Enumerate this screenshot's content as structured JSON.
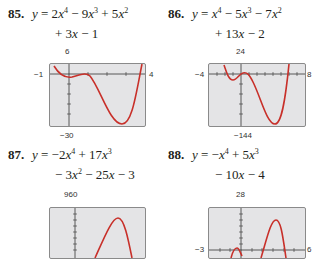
{
  "problems": [
    {
      "number": "85.",
      "line1": "y = 2x⁴ − 9x³ + 5x²",
      "line2": "+ 3x − 1",
      "window": {
        "xmin": "−1",
        "xmax": "4",
        "ymax": "6",
        "ymin": "−30"
      }
    },
    {
      "number": "86.",
      "line1": "y = x⁴ − 5x³ − 7x²",
      "line2": "+ 13x − 2",
      "window": {
        "xmin": "−4",
        "xmax": "8",
        "ymax": "24",
        "ymin": "−144"
      }
    },
    {
      "number": "87.",
      "line1": "y = −2x⁴ + 17x³",
      "line2": "− 3x² − 25x − 3",
      "window": {
        "ymax": "960"
      }
    },
    {
      "number": "88.",
      "line1": "y = −x⁴ + 5x³",
      "line2": "− 10x − 4",
      "window": {
        "xmin": "−3",
        "xmax": "6",
        "ymax": "28"
      }
    }
  ],
  "colors": {
    "curve": "#c8302a",
    "screen": "#e4e4e6",
    "axis": "#333333"
  }
}
